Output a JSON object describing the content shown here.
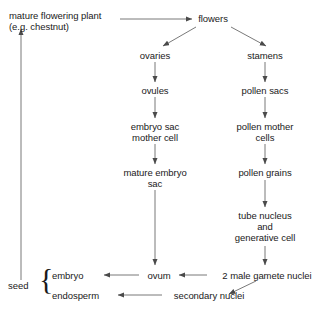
{
  "diagram": {
    "type": "flowchart",
    "colors": {
      "background": "#ffffff",
      "text": "#1a1a1a",
      "edge": "#555555"
    },
    "nodes": {
      "mature_plant": {
        "line1": "mature flowering plant",
        "line2": "(e.g. chestnut)"
      },
      "flowers": {
        "label": "flowers"
      },
      "ovaries": {
        "label": "ovaries"
      },
      "stamens": {
        "label": "stamens"
      },
      "ovules": {
        "label": "ovules"
      },
      "pollen_sacs": {
        "label": "pollen sacs"
      },
      "embryo_sac_mother_cell": {
        "line1": "embryo sac",
        "line2": "mother cell"
      },
      "pollen_mother_cells": {
        "line1": "pollen mother",
        "line2": "cells"
      },
      "mature_embryo_sac": {
        "line1": "mature embryo",
        "line2": "sac"
      },
      "pollen_grains": {
        "label": "pollen grains"
      },
      "tube_nucleus": {
        "line1": "tube nucleus",
        "line2": "and",
        "line3": "generative cell"
      },
      "ovum": {
        "label": "ovum"
      },
      "two_male_gamete_nuclei": {
        "label": "2 male gamete nuclei"
      },
      "embryo": {
        "label": "embryo"
      },
      "endosperm": {
        "label": "endosperm"
      },
      "secondary_nuclei": {
        "label": "secondary nuclei"
      },
      "seed": {
        "label": "seed"
      }
    },
    "edges": [
      {
        "from": "mature_plant",
        "to": "flowers"
      },
      {
        "from": "flowers",
        "to": "ovaries"
      },
      {
        "from": "flowers",
        "to": "stamens"
      },
      {
        "from": "ovaries",
        "to": "ovules"
      },
      {
        "from": "stamens",
        "to": "pollen_sacs"
      },
      {
        "from": "ovules",
        "to": "embryo_sac_mother_cell"
      },
      {
        "from": "pollen_sacs",
        "to": "pollen_mother_cells"
      },
      {
        "from": "embryo_sac_mother_cell",
        "to": "mature_embryo_sac"
      },
      {
        "from": "pollen_mother_cells",
        "to": "pollen_grains"
      },
      {
        "from": "mature_embryo_sac",
        "to": "ovum"
      },
      {
        "from": "pollen_grains",
        "to": "tube_nucleus"
      },
      {
        "from": "tube_nucleus",
        "to": "two_male_gamete_nuclei"
      },
      {
        "from": "two_male_gamete_nuclei",
        "to": "ovum"
      },
      {
        "from": "ovum",
        "to": "embryo"
      },
      {
        "from": "two_male_gamete_nuclei",
        "to": "secondary_nuclei"
      },
      {
        "from": "secondary_nuclei",
        "to": "endosperm"
      },
      {
        "from": "seed",
        "to": "mature_plant"
      }
    ]
  }
}
